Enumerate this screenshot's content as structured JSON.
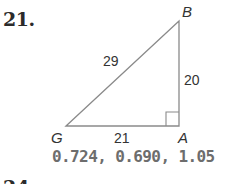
{
  "problem": {
    "number": "21.",
    "triangle": {
      "vertices": {
        "B": "B",
        "G": "G",
        "A": "A"
      },
      "sides": {
        "hypotenuse_GB": "29",
        "leg_AB": "20",
        "leg_GA": "21"
      },
      "right_angle_at": "A"
    },
    "answer": "0.724, 0.690, 1.05"
  },
  "next_problem": {
    "number": "24."
  },
  "colors": {
    "line": "#8a8a8a",
    "label": "#333333",
    "answer": "#6d6d6d"
  }
}
